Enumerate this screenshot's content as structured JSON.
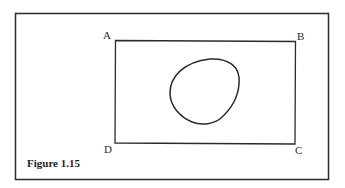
{
  "figure": {
    "caption": "Figure 1.15",
    "labels": {
      "A": "A",
      "B": "B",
      "C": "C",
      "D": "D"
    }
  },
  "colors": {
    "stroke": "#2b2b2b",
    "background": "#ffffff"
  }
}
